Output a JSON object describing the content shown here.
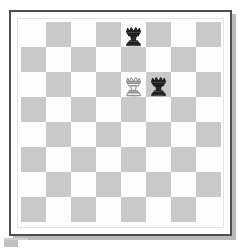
{
  "board": {
    "label": "Chess board",
    "rows": 8,
    "columns": 8,
    "light_square_color": "#fdfdfd",
    "dark_square_color": "#c9c9c9",
    "frame_color": "#4e4e4e",
    "top_left_square_shade": "light",
    "files": [
      "a",
      "b",
      "c",
      "d",
      "e",
      "f",
      "g",
      "h"
    ],
    "ranks": [
      "8",
      "7",
      "6",
      "5",
      "4",
      "3",
      "2",
      "1"
    ],
    "pieces": [
      {
        "square": "e8",
        "row": 1,
        "column": 5,
        "type": "queen",
        "color": "black",
        "square_shade": "light"
      },
      {
        "square": "e6",
        "row": 3,
        "column": 5,
        "type": "queen",
        "color": "white",
        "square_shade": "light"
      },
      {
        "square": "f6",
        "row": 3,
        "column": 6,
        "type": "queen",
        "color": "black",
        "square_shade": "dark"
      }
    ]
  }
}
